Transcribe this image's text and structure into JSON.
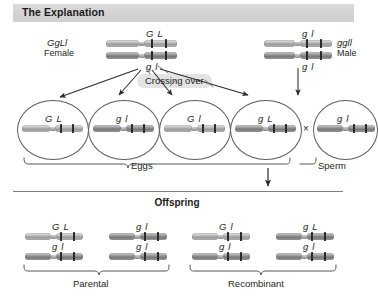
{
  "header": {
    "title": "The Explanation"
  },
  "parents": {
    "female": {
      "genotype": "GgLl",
      "sex": "Female",
      "chromosomes": [
        {
          "alleles": [
            "G",
            "L"
          ],
          "position": "top"
        },
        {
          "alleles": [
            "g",
            "l"
          ],
          "position": "bottom"
        }
      ]
    },
    "male": {
      "genotype": "ggll",
      "sex": "Male",
      "chromosomes": [
        {
          "alleles": [
            "g",
            "l"
          ],
          "position": "top"
        },
        {
          "alleles": [
            "g",
            "l"
          ],
          "position": "bottom"
        }
      ]
    }
  },
  "crossing_over": {
    "label": "Crossing over"
  },
  "gametes": {
    "eggs_label": "Eggs",
    "sperm_label": "Sperm",
    "cross_symbol": "×",
    "eggs": [
      {
        "alleles": [
          "G",
          "L"
        ],
        "type": "parental"
      },
      {
        "alleles": [
          "g",
          "l"
        ],
        "type": "parental"
      },
      {
        "alleles": [
          "G",
          "l"
        ],
        "type": "recombinant"
      },
      {
        "alleles": [
          "g",
          "L"
        ],
        "type": "recombinant"
      }
    ],
    "sperm": [
      {
        "alleles": [
          "g",
          "l"
        ]
      }
    ]
  },
  "offspring": {
    "title": "Offspring",
    "groups": [
      {
        "label": "Parental",
        "individuals": [
          {
            "top": [
              "G",
              "L"
            ],
            "bottom": [
              "g",
              "l"
            ]
          },
          {
            "top": [
              "g",
              "l"
            ],
            "bottom": [
              "g",
              "l"
            ]
          }
        ]
      },
      {
        "label": "Recombinant",
        "individuals": [
          {
            "top": [
              "G",
              "l"
            ],
            "bottom": [
              "g",
              "l"
            ]
          },
          {
            "top": [
              "g",
              "L"
            ],
            "bottom": [
              "g",
              "l"
            ]
          }
        ]
      }
    ]
  },
  "colors": {
    "banner": "#d6d6d6",
    "chromosome": "#9a9a9a",
    "band": "#2b2b2b",
    "line": "#5c5c5c",
    "highlight": "#e3e3e3",
    "text": "#231f20"
  }
}
